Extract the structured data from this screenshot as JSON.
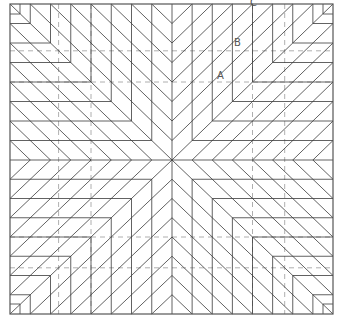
{
  "diagram": {
    "type": "origami-crease-pattern",
    "canvas": {
      "width": 341,
      "height": 323
    },
    "square": {
      "x0": 10,
      "y0": 4,
      "x1": 333,
      "y1": 314
    },
    "center": {
      "x": 172,
      "y": 160
    },
    "pleat_count": 7,
    "colors": {
      "crease": "#3a3a3a",
      "border": "#555555",
      "dashed": "#9a9a9a",
      "label": "#555555"
    },
    "dashed_offsets_frac": [
      0.3,
      0.5
    ],
    "labels": [
      {
        "id": "C",
        "text": "C",
        "x": 250,
        "y": -2
      },
      {
        "id": "B",
        "text": "B",
        "x": 234,
        "y": 38
      },
      {
        "id": "A",
        "text": "A",
        "x": 217,
        "y": 71
      }
    ]
  }
}
